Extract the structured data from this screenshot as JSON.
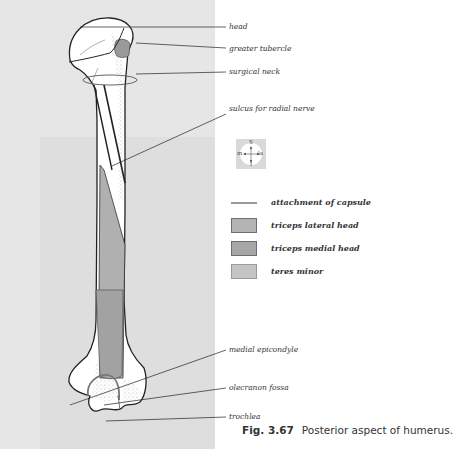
{
  "figure": {
    "number": "Fig. 3.67",
    "title": "Posterior aspect of humerus."
  },
  "labels": [
    {
      "id": "head",
      "text": "head"
    },
    {
      "id": "greater-tubercle",
      "text": "greater tubercle"
    },
    {
      "id": "surgical-neck",
      "text": "surgical neck"
    },
    {
      "id": "sulcus-radial-nerve",
      "text": "sulcus for radial nerve"
    },
    {
      "id": "medial-epicondyle",
      "text": "medial epicondyle"
    },
    {
      "id": "olecranon-fossa",
      "text": "olecranon fossa"
    },
    {
      "id": "trochlea",
      "text": "trochlea"
    }
  ],
  "compass": {
    "superior": "S",
    "inferior": "I",
    "medial": "m",
    "lateral": "la"
  },
  "legend": [
    {
      "type": "line",
      "label": "attachment of capsule",
      "color": "#9a9a9a"
    },
    {
      "type": "swatch",
      "label": "triceps lateral head",
      "color": "#b4b4b4",
      "border": "#6e6e6e"
    },
    {
      "type": "swatch",
      "label": "triceps medial head",
      "color": "#a6a6a6",
      "border": "#6e6e6e"
    },
    {
      "type": "swatch",
      "label": "teres minor",
      "color": "#c4c4c4",
      "border": "#9a9a9a"
    }
  ],
  "colors": {
    "page_left_bg": "#e6e6e6",
    "bone_fill": "#ffffff",
    "muscle_gray": "#b0b0b0",
    "outline": "#222222"
  }
}
